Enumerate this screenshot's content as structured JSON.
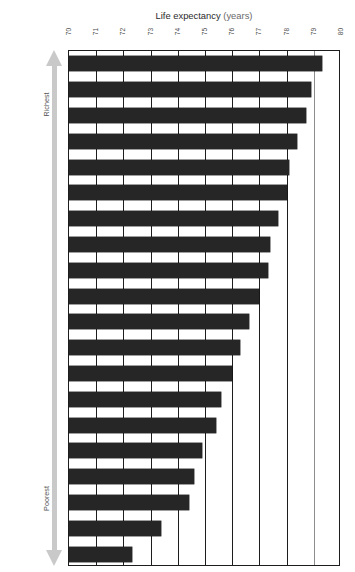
{
  "figure": {
    "caption_prefix": "Figure 3:",
    "caption_rest_a": " Life expectancy is strongly related to income ",
    "caption_underlined": "within",
    "caption_rest_b": " rich countries",
    "caption_full": "Figure 3: Life expectancy is strongly related to income within rich countries"
  },
  "axes": {
    "x_title_main": "Life expectancy",
    "x_title_unit": "(years)",
    "y_title_main": "Local neighbourhoods",
    "y_title_unit": "(England and Wales)",
    "range_top_label": "Richest",
    "range_bottom_label": "Poorest",
    "arrow_icon_top": "arrow-up-icon",
    "arrow_icon_bottom": "arrow-down-icon"
  },
  "colors": {
    "bar": "#262626",
    "axis": "#1d1d1d",
    "grid": "#1d1d1d",
    "arrow": "#c9c9c9",
    "background": "#ffffff",
    "text": "#2b2b2b"
  },
  "chart_data": {
    "type": "bar",
    "orientation": "horizontal",
    "title": "Life expectancy (years)",
    "xlabel": "Life expectancy (years)",
    "ylabel": "Local neighbourhoods (England and Wales)",
    "xlim": [
      70,
      80
    ],
    "ylim_note": "20 income-ranked neighbourhood groups, richest at top to poorest at bottom",
    "grid": true,
    "grid_axis": "x",
    "legend": false,
    "xticks": [
      70,
      71,
      72,
      73,
      74,
      75,
      76,
      77,
      78,
      79,
      80
    ],
    "xticklabels": [
      "70",
      "71",
      "72",
      "73",
      "74",
      "75",
      "76",
      "77",
      "78",
      "79",
      "80"
    ],
    "categories": [
      "1 (Richest)",
      "2",
      "3",
      "4",
      "5",
      "6",
      "7",
      "8",
      "9",
      "10",
      "11",
      "12",
      "13",
      "14",
      "15",
      "16",
      "17",
      "18",
      "19",
      "20 (Poorest)"
    ],
    "values": [
      79.3,
      78.9,
      78.7,
      78.4,
      78.1,
      78.0,
      77.7,
      77.4,
      77.3,
      77.0,
      76.6,
      76.3,
      76.0,
      75.6,
      75.4,
      74.9,
      74.6,
      74.4,
      73.4,
      72.3
    ],
    "value_labels_shown": false,
    "bar_count": 20
  }
}
